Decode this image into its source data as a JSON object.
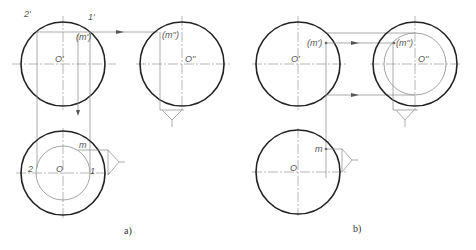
{
  "figure": {
    "panel_a": {
      "caption": "a)",
      "front_view": {
        "labels": {
          "p2": "2'",
          "p1": "1'",
          "m": "(m')",
          "center": "O'"
        }
      },
      "side_view": {
        "labels": {
          "m": "(m'')",
          "center": "O''"
        }
      },
      "top_view": {
        "labels": {
          "p2": "2",
          "p1": "1",
          "m": "m",
          "center": "O"
        }
      }
    },
    "panel_b": {
      "caption": "b)",
      "front_view": {
        "labels": {
          "m": "(m')",
          "center": "O'"
        }
      },
      "side_view": {
        "labels": {
          "m": "(m'')",
          "center": "O''"
        }
      },
      "top_view": {
        "labels": {
          "m": "m",
          "center": "O"
        }
      }
    },
    "colors": {
      "outline": "#222222",
      "construction": "#888888",
      "background": "#ffffff"
    }
  }
}
